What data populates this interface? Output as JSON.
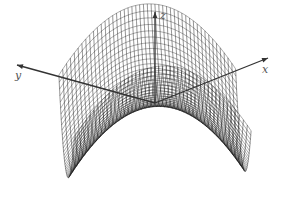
{
  "figure": {
    "type": "3d-surface-wireframe",
    "surface": "saddle (hyperbolic paraboloid)",
    "width": 284,
    "height": 212,
    "background": "#ffffff",
    "line_color": "#111111",
    "axis_color": "#333333",
    "label_color": "#555555"
  },
  "axes": {
    "x": {
      "label": "x",
      "label_pos": [
        262,
        64
      ]
    },
    "y": {
      "label": "y",
      "label_pos": [
        15,
        70
      ]
    },
    "z": {
      "label": "z",
      "label_pos": [
        160,
        10
      ]
    }
  },
  "projection": {
    "origin": [
      155,
      103
    ],
    "x_dir": [
      26,
      -11
    ],
    "y_dir": [
      -31,
      -9
    ],
    "z_dir": [
      0,
      -21
    ]
  },
  "surface_params": {
    "u_range": [
      -1.55,
      1.55
    ],
    "v_range": [
      -1.55,
      1.55
    ],
    "rows": 46,
    "cols": 46,
    "z_scale": 1.35,
    "x_offset": 1.2,
    "y_offset": -0.1
  }
}
